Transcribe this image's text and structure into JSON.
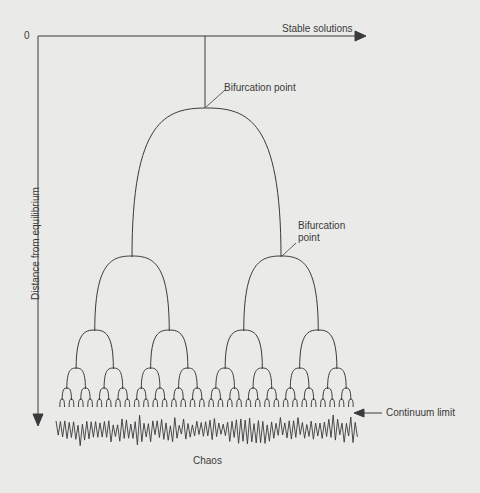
{
  "diagram": {
    "origin_label": "0",
    "x_axis_label": "Stable solutions",
    "y_axis_label": "Distance from equilibrium",
    "annotations": {
      "bifurcation_point_1": "Bifurcation point",
      "bifurcation_point_2_line1": "Bifurcation",
      "bifurcation_point_2_line2": "point",
      "continuum_limit": "Continuum limit",
      "chaos": "Chaos"
    },
    "levels": [
      {
        "level": 1,
        "branches": 2
      },
      {
        "level": 2,
        "branches": 4
      },
      {
        "level": 3,
        "branches": 8
      },
      {
        "level": 4,
        "branches": 16
      },
      {
        "level": 5,
        "branches": 32
      },
      {
        "level": 6,
        "branches": 64
      }
    ],
    "colors": {
      "background": "#eaeae8",
      "line": "#3a3a3a"
    }
  }
}
